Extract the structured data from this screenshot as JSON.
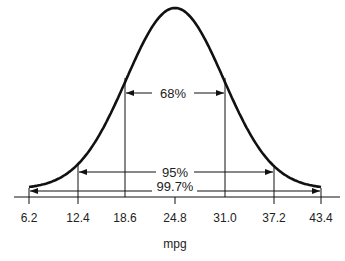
{
  "chart_data": {
    "type": "line",
    "title": "",
    "xlabel": "mpg",
    "ylabel": "",
    "distribution": "normal",
    "mean": 24.8,
    "std_dev": 6.2,
    "x_ticks": [
      "6.2",
      "12.4",
      "18.6",
      "24.8",
      "31.0",
      "37.2",
      "43.4"
    ],
    "xlim": [
      6.2,
      43.4
    ],
    "grid": false,
    "annotations": [
      {
        "label": "68%",
        "from": 18.6,
        "to": 31.0,
        "sigma": 1
      },
      {
        "label": "95%",
        "from": 12.4,
        "to": 37.2,
        "sigma": 2
      },
      {
        "label": "99.7%",
        "from": 6.2,
        "to": 43.4,
        "sigma": 3
      }
    ]
  },
  "labels": {
    "pct68": "68%",
    "pct95": "95%",
    "pct997": "99.7%",
    "xlabel": "mpg",
    "ticks": [
      "6.2",
      "12.4",
      "18.6",
      "24.8",
      "31.0",
      "37.2",
      "43.4"
    ]
  },
  "colors": {
    "line": "#111111",
    "text": "#222222",
    "background": "#ffffff"
  }
}
